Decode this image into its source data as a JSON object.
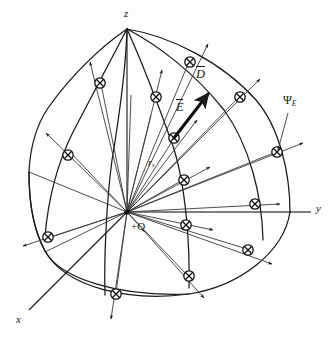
{
  "figure": {
    "background_color": "#fdfdfd",
    "stroke_color": "#1a1a1a"
  },
  "axes": [
    {
      "name": "z-axis",
      "label": "z",
      "label_x": 124,
      "label_y": 8,
      "from": [
        127,
        212
      ],
      "to": [
        127,
        29
      ]
    },
    {
      "name": "y-axis",
      "label": "y",
      "label_x": 316,
      "label_y": 206,
      "from": [
        127,
        212
      ],
      "to": [
        312,
        212
      ]
    },
    {
      "name": "x-axis",
      "label": "x",
      "label_x": 16,
      "label_y": 318,
      "from": [
        127,
        212
      ],
      "to": [
        29,
        310
      ]
    }
  ],
  "charge": {
    "label": "+Q",
    "label_x": 131,
    "label_y": 226,
    "origin": [
      127,
      212
    ]
  },
  "vectors": [
    {
      "name": "d-vector",
      "label": "D",
      "overbar": true,
      "label_x": 196,
      "label_y": 74,
      "from": [
        174,
        138
      ],
      "to": [
        211,
        91
      ]
    },
    {
      "name": "e-vector",
      "label": "E",
      "overbar": true,
      "label_x": 176,
      "label_y": 107,
      "from": [
        174,
        138
      ],
      "to": [
        211,
        91
      ]
    }
  ],
  "annotations": [
    {
      "name": "flux-label",
      "label": "Ψ",
      "subscript": "E",
      "label_x": 285,
      "label_y": 100,
      "leader_from": [
        288,
        113
      ],
      "leader_to": [
        277,
        152
      ]
    },
    {
      "name": "radius-label",
      "label": "r",
      "subscript": "s",
      "label_x": 148,
      "label_y": 163
    }
  ],
  "surface": {
    "name": "spherical-cap-patch",
    "pole": [
      127,
      29
    ],
    "flux_marker": "circled-x",
    "marker_radius": 5.2,
    "marker_count": 14
  },
  "flux_markers": [
    {
      "x": 190,
      "y": 62,
      "arrow_to": [
        209,
        43
      ]
    },
    {
      "x": 100,
      "y": 83,
      "arrow_to": [
        92,
        59
      ]
    },
    {
      "x": 240,
      "y": 97,
      "arrow_to": [
        261,
        80
      ]
    },
    {
      "x": 156,
      "y": 97,
      "arrow_to": [
        163,
        72
      ]
    },
    {
      "x": 68,
      "y": 155,
      "arrow_to": [
        46,
        134
      ]
    },
    {
      "x": 174,
      "y": 138,
      "arrow_to": [
        198,
        121
      ]
    },
    {
      "x": 277,
      "y": 152,
      "arrow_to": [
        303,
        143
      ]
    },
    {
      "x": 184,
      "y": 180,
      "arrow_to": [
        210,
        168
      ]
    },
    {
      "x": 48,
      "y": 237,
      "arrow_to": [
        24,
        245
      ]
    },
    {
      "x": 186,
      "y": 225,
      "arrow_to": [
        213,
        230
      ]
    },
    {
      "x": 248,
      "y": 250,
      "arrow_to": [
        272,
        263
      ]
    },
    {
      "x": 189,
      "y": 276,
      "arrow_to": [
        205,
        297
      ]
    },
    {
      "x": 116,
      "y": 294,
      "arrow_to": [
        111,
        318
      ]
    },
    {
      "x": 255,
      "y": 204,
      "arrow_to": [
        279,
        204
      ]
    }
  ]
}
